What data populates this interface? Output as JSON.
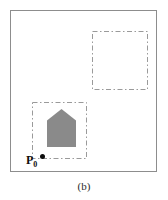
{
  "figure": {
    "caption": "(b)",
    "panel": {
      "border_color": "#8d8d8d",
      "background_color": "#ffffff"
    },
    "annotations": {
      "origin_point_label": "P",
      "origin_point_subscript": "0",
      "origin_point_color": "#0e0e0e"
    },
    "regions": [
      {
        "name": "top-right-empty-region",
        "style": "dash-dot",
        "stroke_color": "#9a9a9a",
        "contents": "empty"
      },
      {
        "name": "bottom-left-object-region",
        "style": "dash-dot",
        "stroke_color": "#9a9a9a",
        "contents": "house-polygon"
      }
    ],
    "shapes": [
      {
        "name": "house-polygon",
        "type": "pentagon",
        "fill_color": "#8a8a8a"
      }
    ]
  }
}
